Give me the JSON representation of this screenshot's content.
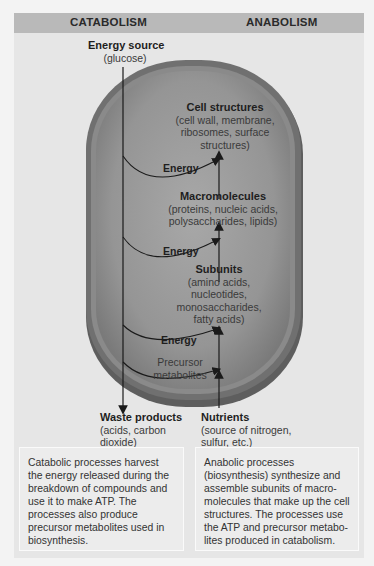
{
  "header": {
    "left_title": "CATABOLISM",
    "right_title": "ANABOLISM"
  },
  "nodes": {
    "energy_source": {
      "title": "Energy source",
      "detail": "(glucose)"
    },
    "cell_structures": {
      "title": "Cell structures",
      "detail_lines": [
        "(cell wall, membrane,",
        "ribosomes, surface",
        "structures)"
      ]
    },
    "macromolecules": {
      "title": "Macromolecules",
      "detail_lines": [
        "(proteins, nucleic acids,",
        "polysaccharides, lipids)"
      ]
    },
    "subunits": {
      "title": "Subunits",
      "detail_lines": [
        "(amino acids,",
        "nucleotides,",
        "monosaccharides,",
        "fatty acids)"
      ]
    },
    "waste_products": {
      "title": "Waste products",
      "detail_lines": [
        "(acids, carbon",
        "dioxide)"
      ]
    },
    "nutrients": {
      "title": "Nutrients",
      "detail_lines": [
        "(source of nitrogen,",
        "sulfur, etc.)"
      ]
    }
  },
  "arrows": {
    "energy_1": "Energy",
    "energy_2": "Energy",
    "energy_3": "Energy",
    "precursor_line1": "Precursor",
    "precursor_line2": "metabolites"
  },
  "captions": {
    "catabolism": "Catabolic processes harvest the energy released during the breakdown of compounds and use it to make ATP. The processes also produce precursor metabolites used in biosynthesis.",
    "anabolism": "Anabolic processes (biosynthesis) synthesize and assemble subunits of macro-molecules that make up the cell structures. The processes use the ATP and precursor metabo-lites produced in catabolism."
  },
  "colors": {
    "header_bg": "#b9b9b9",
    "panel_bg": "#e6e6e6",
    "cell_wall": "#6e6e6e",
    "cytoplasm": "#9a9a9a"
  }
}
